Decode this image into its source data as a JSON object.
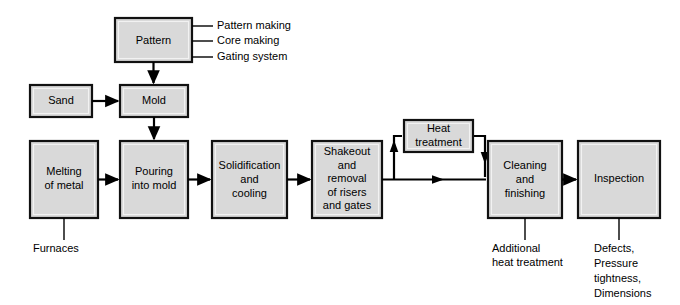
{
  "diagram": {
    "background_color": "#ffffff",
    "box_fill_color": "#d9d9d9",
    "box_border_color": "#111111",
    "line_color": "#000000",
    "text_color": "#000000"
  },
  "boxes": {
    "pattern": {
      "label": "Pattern"
    },
    "sand": {
      "label": "Sand"
    },
    "mold": {
      "label": "Mold"
    },
    "melting": {
      "line1": "Melting",
      "line2": "of metal"
    },
    "pouring": {
      "line1": "Pouring",
      "line2": "into mold"
    },
    "solidification": {
      "line1": "Solidification",
      "line2": "and",
      "line3": "cooling"
    },
    "shakeout": {
      "line1": "Shakeout",
      "line2": "and",
      "line3": "removal",
      "line4": "of risers",
      "line5": "and gates"
    },
    "heat_treatment": {
      "line1": "Heat",
      "line2": "treatment"
    },
    "cleaning": {
      "line1": "Cleaning",
      "line2": "and",
      "line3": "finishing"
    },
    "inspection": {
      "label": "Inspection"
    }
  },
  "annotations": {
    "pattern_notes": [
      "Pattern making",
      "Core making",
      "Gating system"
    ],
    "furnaces": {
      "line1": "Furnaces"
    },
    "additional_heat_treatment": {
      "line1": "Additional",
      "line2": "heat treatment"
    },
    "inspection_notes": {
      "line1": "Defects,",
      "line2": "Pressure",
      "line3": "tightness,",
      "line4": "Dimensions"
    }
  }
}
